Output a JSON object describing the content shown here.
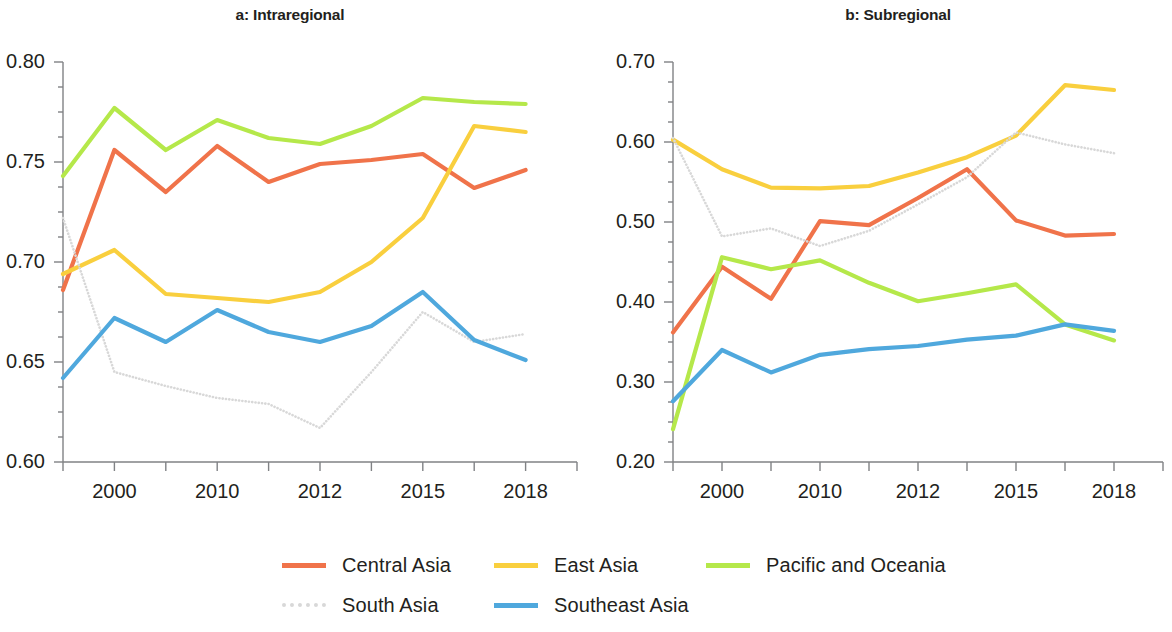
{
  "figure": {
    "width": 1172,
    "height": 632
  },
  "legend": {
    "rows": [
      [
        {
          "key": "central_asia",
          "label": "Central Asia",
          "color": "#f0734a",
          "style": "solid"
        },
        {
          "key": "east_asia",
          "label": "East Asia",
          "color": "#f9cf3e",
          "style": "solid"
        },
        {
          "key": "pacific",
          "label": "Pacific and Oceania",
          "color": "#b5e84a",
          "style": "solid"
        }
      ],
      [
        {
          "key": "south_asia",
          "label": "South Asia",
          "color": "#d8d8d8",
          "style": "dotted"
        },
        {
          "key": "southeast_asia",
          "label": "Southeast Asia",
          "color": "#4fa8dd",
          "style": "solid"
        }
      ]
    ]
  },
  "chart_data": [
    {
      "type": "line",
      "panel": "a",
      "title": "a: Intraregional",
      "xlabel": "",
      "ylabel": "",
      "x": [
        1,
        2,
        3,
        4,
        5,
        6,
        7,
        8,
        9,
        10,
        11
      ],
      "xtick_labels": [
        "",
        "2000",
        "",
        "2010",
        "",
        "2012",
        "",
        "2015",
        "",
        "2018",
        ""
      ],
      "xticks_all": [
        1,
        2,
        3,
        4,
        5,
        6,
        7,
        8,
        9,
        10,
        11
      ],
      "ytick_labels": [
        "0.80",
        "0.75",
        "0.70",
        "0.65",
        "0.60"
      ],
      "yticks": [
        0.8,
        0.75,
        0.7,
        0.65,
        0.6
      ],
      "ylim": [
        0.6,
        0.8
      ],
      "y_minor_step": 0.0125,
      "grid": false,
      "series": [
        {
          "name": "Central Asia",
          "color": "#f0734a",
          "style": "solid",
          "values": [
            0.686,
            0.756,
            0.735,
            0.758,
            0.74,
            0.749,
            0.751,
            0.754,
            0.737,
            0.746
          ]
        },
        {
          "name": "East Asia",
          "color": "#f9cf3e",
          "style": "solid",
          "values": [
            0.694,
            0.706,
            0.684,
            0.682,
            0.68,
            0.685,
            0.7,
            0.722,
            0.768,
            0.765
          ]
        },
        {
          "name": "Pacific and Oceania",
          "color": "#b5e84a",
          "style": "solid",
          "values": [
            0.743,
            0.777,
            0.756,
            0.771,
            0.762,
            0.759,
            0.768,
            0.782,
            0.78,
            0.779
          ]
        },
        {
          "name": "South Asia",
          "color": "#d8d8d8",
          "style": "dotted",
          "values": [
            0.722,
            0.645,
            0.638,
            0.632,
            0.629,
            0.617,
            0.645,
            0.675,
            0.66,
            0.664
          ]
        },
        {
          "name": "Southeast Asia",
          "color": "#4fa8dd",
          "style": "solid",
          "values": [
            0.642,
            0.672,
            0.66,
            0.676,
            0.665,
            0.66,
            0.668,
            0.685,
            0.661,
            0.651
          ]
        }
      ],
      "x_positions": [
        1,
        2,
        3,
        4,
        5,
        6,
        7,
        8,
        9,
        10
      ]
    },
    {
      "type": "line",
      "panel": "b",
      "title": "b: Subregional",
      "xlabel": "",
      "ylabel": "",
      "x": [
        1,
        2,
        3,
        4,
        5,
        6,
        7,
        8,
        9,
        10,
        11
      ],
      "xtick_labels": [
        "",
        "2000",
        "",
        "2010",
        "",
        "2012",
        "",
        "2015",
        "",
        "2018",
        ""
      ],
      "xticks_all": [
        1,
        2,
        3,
        4,
        5,
        6,
        7,
        8,
        9,
        10,
        11
      ],
      "ytick_labels": [
        "0.70",
        "0.60",
        "0.50",
        "0.40",
        "0.30",
        "0.20"
      ],
      "yticks": [
        0.7,
        0.6,
        0.5,
        0.4,
        0.3,
        0.2
      ],
      "ylim": [
        0.2,
        0.7
      ],
      "y_minor_step": 0.025,
      "grid": false,
      "series": [
        {
          "name": "Central Asia",
          "color": "#f0734a",
          "style": "solid",
          "values": [
            0.362,
            0.444,
            0.404,
            0.501,
            0.496,
            0.53,
            0.566,
            0.502,
            0.483,
            0.485
          ]
        },
        {
          "name": "East Asia",
          "color": "#f9cf3e",
          "style": "solid",
          "values": [
            0.603,
            0.566,
            0.543,
            0.542,
            0.545,
            0.562,
            0.581,
            0.608,
            0.671,
            0.665
          ]
        },
        {
          "name": "Pacific and Oceania",
          "color": "#b5e84a",
          "style": "solid",
          "values": [
            0.241,
            0.456,
            0.441,
            0.452,
            0.424,
            0.401,
            0.411,
            0.422,
            0.372,
            0.352
          ]
        },
        {
          "name": "South Asia",
          "color": "#d8d8d8",
          "style": "dotted",
          "values": [
            0.605,
            0.482,
            0.492,
            0.47,
            0.489,
            0.522,
            0.556,
            0.612,
            0.597,
            0.586
          ]
        },
        {
          "name": "Southeast Asia",
          "color": "#4fa8dd",
          "style": "solid",
          "values": [
            0.276,
            0.34,
            0.312,
            0.334,
            0.341,
            0.345,
            0.353,
            0.358,
            0.372,
            0.364
          ]
        }
      ],
      "x_positions": [
        1,
        2,
        3,
        4,
        5,
        6,
        7,
        8,
        9,
        10
      ]
    }
  ]
}
